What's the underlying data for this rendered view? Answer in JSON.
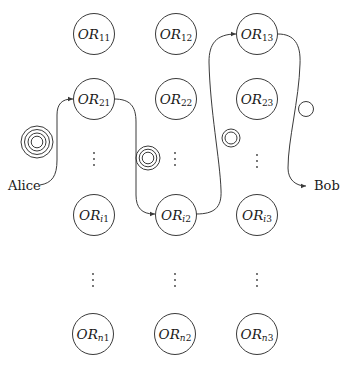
{
  "diagram": {
    "endpoints": {
      "source": "Alice",
      "destination": "Bob"
    },
    "routers": [
      {
        "id": "OR11",
        "prefix": "OR",
        "sub": "11",
        "row": "1",
        "col": 1
      },
      {
        "id": "OR12",
        "prefix": "OR",
        "sub": "12",
        "row": "1",
        "col": 2
      },
      {
        "id": "OR13",
        "prefix": "OR",
        "sub": "13",
        "row": "1",
        "col": 3
      },
      {
        "id": "OR21",
        "prefix": "OR",
        "sub": "21",
        "row": "2",
        "col": 1
      },
      {
        "id": "OR22",
        "prefix": "OR",
        "sub": "22",
        "row": "2",
        "col": 2
      },
      {
        "id": "OR23",
        "prefix": "OR",
        "sub": "23",
        "row": "2",
        "col": 3
      },
      {
        "id": "ORi1",
        "prefix": "OR",
        "sub_var": "i",
        "sub": "1",
        "row": "i",
        "col": 1
      },
      {
        "id": "ORi2",
        "prefix": "OR",
        "sub_var": "i",
        "sub": "2",
        "row": "i",
        "col": 2
      },
      {
        "id": "ORi3",
        "prefix": "OR",
        "sub_var": "i",
        "sub": "3",
        "row": "i",
        "col": 3
      },
      {
        "id": "ORn1",
        "prefix": "OR",
        "sub_var": "n",
        "sub": "1",
        "row": "n",
        "col": 1
      },
      {
        "id": "ORn2",
        "prefix": "OR",
        "sub_var": "n",
        "sub": "2",
        "row": "n",
        "col": 2
      },
      {
        "id": "ORn3",
        "prefix": "OR",
        "sub_var": "n",
        "sub": "3",
        "row": "n",
        "col": 3
      }
    ],
    "path": [
      "Alice",
      "OR21",
      "ORi2",
      "OR13",
      "Bob"
    ],
    "onion_layers": [
      {
        "position": "between Alice and OR21",
        "rings": 4
      },
      {
        "position": "between OR21 and ORi2",
        "rings": 3
      },
      {
        "position": "between ORi2 and OR13",
        "rings": 2
      },
      {
        "position": "between OR13 and Bob",
        "rings": 1
      }
    ],
    "ellipsis": "⋮"
  }
}
